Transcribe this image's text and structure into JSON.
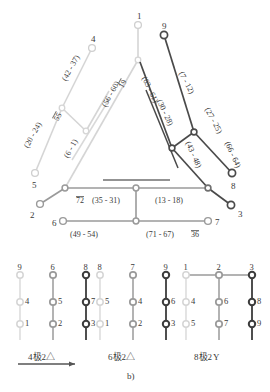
{
  "figure": {
    "caption": "b)",
    "part_a": {
      "nodes": [
        {
          "id": "n1",
          "label": "1",
          "x": 138,
          "y": 25,
          "color": "#cfcfcf",
          "r": 3.4,
          "lw": 1.3
        },
        {
          "id": "n4",
          "label": "4",
          "x": 92,
          "y": 48,
          "color": "#cfcfcf",
          "r": 3.4,
          "lw": 1.3
        },
        {
          "id": "n9",
          "label": "9",
          "x": 164,
          "y": 35,
          "color": "#4a4a4a",
          "r": 3.6,
          "lw": 1.7
        },
        {
          "id": "n5",
          "label": "5",
          "x": 35,
          "y": 173,
          "color": "#cfcfcf",
          "r": 3.4,
          "lw": 1.3
        },
        {
          "id": "n2",
          "label": "2",
          "x": 40,
          "y": 204,
          "color": "#9a9a9a",
          "r": 3.4,
          "lw": 1.4
        },
        {
          "id": "n6",
          "label": "6",
          "x": 63,
          "y": 221,
          "color": "#9a9a9a",
          "r": 3.4,
          "lw": 1.4
        },
        {
          "id": "n7",
          "label": "7",
          "x": 208,
          "y": 221,
          "color": "#9a9a9a",
          "r": 3.4,
          "lw": 1.4
        },
        {
          "id": "n3",
          "label": "3",
          "x": 231,
          "y": 205,
          "color": "#4a4a4a",
          "r": 3.6,
          "lw": 1.7
        },
        {
          "id": "n8",
          "label": "8",
          "x": 232,
          "y": 173,
          "color": "#4a4a4a",
          "r": 3.6,
          "lw": 1.7
        }
      ],
      "edge_labels": [
        {
          "text": "(42 - 37)",
          "x": 60,
          "y": 78,
          "rot": -61
        },
        {
          "text": "(56 - 60)",
          "x": 100,
          "y": 104,
          "rot": -61
        },
        {
          "text": "19",
          "x": 117,
          "y": 85,
          "rot": -61,
          "overline": true
        },
        {
          "text": "(20 - 24)",
          "x": 22,
          "y": 145,
          "rot": -61
        },
        {
          "text": "55",
          "x": 52,
          "y": 118,
          "rot": -61,
          "overline": true
        },
        {
          "text": "(6 - 1)",
          "x": 62,
          "y": 155,
          "rot": -61
        },
        {
          "text": "(63 - 61)",
          "x": 148,
          "y": 75,
          "rot": 64
        },
        {
          "text": "(30 - 28)",
          "x": 163,
          "y": 98,
          "rot": 64
        },
        {
          "text": "(7 - 12)",
          "x": 185,
          "y": 70,
          "rot": 62
        },
        {
          "text": "(27 - 25)",
          "x": 211,
          "y": 106,
          "rot": 62
        },
        {
          "text": "(43 - 48)",
          "x": 192,
          "y": 140,
          "rot": 66
        },
        {
          "text": "(66 - 64)",
          "x": 231,
          "y": 140,
          "rot": 65
        },
        {
          "text": "72",
          "x": 76,
          "y": 196,
          "overline": true
        },
        {
          "text": "(35 - 31)",
          "x": 92,
          "y": 196
        },
        {
          "text": "(13 - 18)",
          "x": 155,
          "y": 196
        },
        {
          "text": "(49 - 54)",
          "x": 70,
          "y": 230
        },
        {
          "text": "(71 - 67)",
          "x": 146,
          "y": 230
        },
        {
          "text": "36",
          "x": 191,
          "y": 230,
          "overline": true
        }
      ]
    },
    "part_b": {
      "groups": [
        {
          "name": "4-pole-2-delta",
          "caption": "4极2△",
          "has_arrow": true,
          "columns": [
            {
              "top_label": "9",
              "mid_label": "4",
              "bot_label": "1",
              "color": "#d5d5d5",
              "lw": 1.3
            },
            {
              "top_label": "6",
              "mid_label": "5",
              "bot_label": "2",
              "color": "#9a9a9a",
              "lw": 1.5
            },
            {
              "top_label": "8",
              "mid_label": "7",
              "bot_label": "3",
              "color": "#3c3c3c",
              "lw": 1.8
            }
          ]
        },
        {
          "name": "6-pole-2-delta",
          "caption": "6极2△",
          "has_arrow": false,
          "columns": [
            {
              "top_label": "8",
              "mid_label": "5",
              "bot_label": "1",
              "color": "#d5d5d5",
              "lw": 1.3
            },
            {
              "top_label": "7",
              "mid_label": "4",
              "bot_label": "2",
              "color": "#9a9a9a",
              "lw": 1.5
            },
            {
              "top_label": "9",
              "mid_label": "6",
              "bot_label": "3",
              "color": "#3c3c3c",
              "lw": 1.8
            }
          ]
        },
        {
          "name": "8-pole-2-wye",
          "caption": "8极2",
          "caption_symbol": "Y",
          "has_arrow": false,
          "top_link": true,
          "columns": [
            {
              "top_label": "1",
              "mid_label": "4",
              "bot_label": "5",
              "color": "#d5d5d5",
              "lw": 1.3
            },
            {
              "top_label": "2",
              "mid_label": "6",
              "bot_label": "7",
              "color": "#9a9a9a",
              "lw": 1.5
            },
            {
              "top_label": "3",
              "mid_label": "8",
              "bot_label": "9",
              "color": "#3c3c3c",
              "lw": 1.8
            }
          ]
        }
      ]
    }
  }
}
